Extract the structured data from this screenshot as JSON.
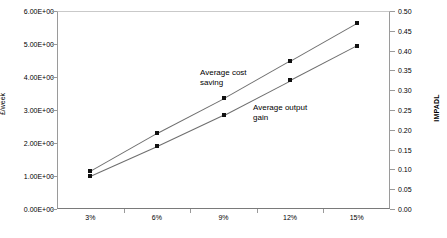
{
  "chart_data": {
    "type": "line",
    "title": "",
    "subtitle": "",
    "xlabel": "",
    "ylabel": "£/week",
    "y2label": "IMPADL",
    "categories": [
      "3%",
      "6%",
      "9%",
      "12%",
      "15%"
    ],
    "ylim": [
      0,
      6
    ],
    "y2lim": [
      0,
      0.5
    ],
    "grid": false,
    "legend_position": "none",
    "y_ticks": [
      "0.00E+00",
      "1.00E+00",
      "2.00E+00",
      "3.00E+00",
      "4.00E+00",
      "5.00E+00",
      "6.00E+00"
    ],
    "y_tick_values": [
      0,
      1,
      2,
      3,
      4,
      5,
      6
    ],
    "y2_ticks": [
      "0.00",
      "0.05",
      "0.10",
      "0.15",
      "0.20",
      "0.25",
      "0.30",
      "0.35",
      "0.40",
      "0.45",
      "0.50"
    ],
    "y2_tick_values": [
      0,
      0.05,
      0.1,
      0.15,
      0.2,
      0.25,
      0.3,
      0.35,
      0.4,
      0.45,
      0.5
    ],
    "series": [
      {
        "name": "Average cost saving",
        "axis": "left",
        "values": [
          1.15,
          2.3,
          3.35,
          4.5,
          5.65
        ],
        "marker": "square",
        "color": "#111111",
        "line_color": "#6e6e6e"
      },
      {
        "name": "Average output gain",
        "axis": "left",
        "values": [
          1.0,
          1.9,
          2.85,
          3.9,
          4.95
        ],
        "marker": "square",
        "color": "#111111",
        "line_color": "#6e6e6e"
      }
    ],
    "annotations": [
      {
        "text": "Average cost\nsaving",
        "series": "Average cost saving"
      },
      {
        "text": "Average output\ngain",
        "series": "Average output gain"
      }
    ]
  }
}
